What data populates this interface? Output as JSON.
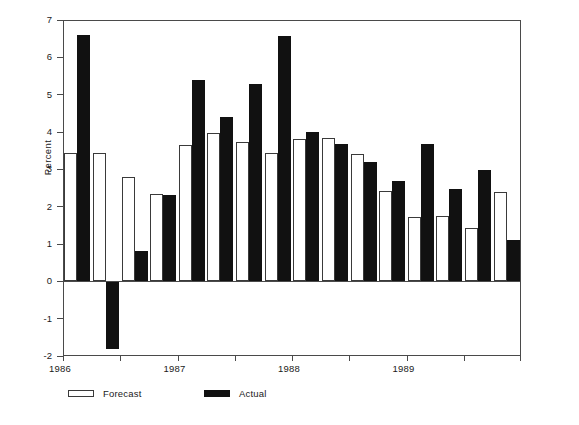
{
  "chart_data": {
    "type": "bar",
    "title": "",
    "subtitle": "",
    "xlabel": "",
    "ylabel": "Percent",
    "ylim": [
      -2,
      7
    ],
    "ytick_labels": [
      "7",
      "6",
      "5",
      "4",
      "3",
      "2",
      "1",
      "0",
      "-1",
      "-2"
    ],
    "ytick_values": [
      7,
      6,
      5,
      4,
      3,
      2,
      1,
      0,
      -1,
      -2
    ],
    "grid": false,
    "legend_position": "bottom-left",
    "categories": [
      "1986 Q1",
      "1986 Q2",
      "1986 Q3",
      "1986 Q4",
      "1987 Q1",
      "1987 Q2",
      "1987 Q3",
      "1987 Q4",
      "1988 Q1",
      "1988 Q2",
      "1988 Q3",
      "1988 Q4",
      "1989 Q1",
      "1989 Q2",
      "1989 Q3",
      "1989 Q4"
    ],
    "xtick_labels": [
      "1986",
      "1987",
      "1988",
      "1989"
    ],
    "series": [
      {
        "name": "Forecast",
        "color": "#ffffff",
        "edge_color": "#3a3a3a",
        "values": [
          3.45,
          3.43,
          2.79,
          2.33,
          3.65,
          3.97,
          3.72,
          3.43,
          3.81,
          3.83,
          3.42,
          2.43,
          1.72,
          1.74,
          1.44,
          2.39
        ]
      },
      {
        "name": "Actual",
        "color": "#111111",
        "edge_color": "#111111",
        "values": [
          6.6,
          -1.82,
          0.8,
          2.3,
          5.38,
          4.39,
          5.28,
          6.57,
          3.99,
          3.68,
          3.19,
          2.68,
          3.68,
          2.48,
          2.98,
          1.12
        ]
      }
    ]
  },
  "legend": {
    "entries": [
      {
        "label": "Forecast",
        "style": "forecast"
      },
      {
        "label": "Actual",
        "style": "actual"
      }
    ]
  },
  "axes": {
    "y_title": "Percent"
  }
}
